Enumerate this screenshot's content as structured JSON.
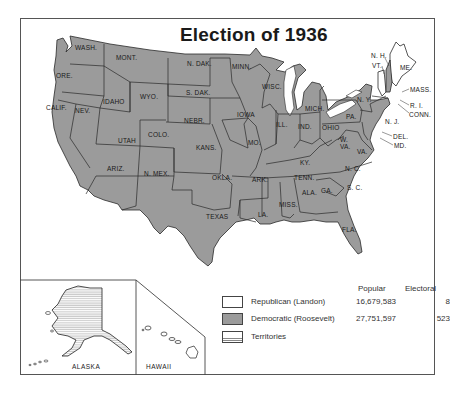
{
  "title": "Election of 1936",
  "colors": {
    "democratic": "#9b9b9b",
    "republican": "#ffffff",
    "outline": "#2a2a2a"
  },
  "states": [
    {
      "abbr": "WASH.",
      "party": "Democratic"
    },
    {
      "abbr": "ORE.",
      "party": "Democratic"
    },
    {
      "abbr": "CALIF.",
      "party": "Democratic"
    },
    {
      "abbr": "NEV.",
      "party": "Democratic"
    },
    {
      "abbr": "IDAHO",
      "party": "Democratic"
    },
    {
      "abbr": "MONT.",
      "party": "Democratic"
    },
    {
      "abbr": "WYO.",
      "party": "Democratic"
    },
    {
      "abbr": "UTAH",
      "party": "Democratic"
    },
    {
      "abbr": "COLO.",
      "party": "Democratic"
    },
    {
      "abbr": "ARIZ.",
      "party": "Democratic"
    },
    {
      "abbr": "N. MEX.",
      "party": "Democratic"
    },
    {
      "abbr": "N. DAK.",
      "party": "Democratic"
    },
    {
      "abbr": "S. DAK.",
      "party": "Democratic"
    },
    {
      "abbr": "NEBR.",
      "party": "Democratic"
    },
    {
      "abbr": "KANS.",
      "party": "Democratic"
    },
    {
      "abbr": "OKLA.",
      "party": "Democratic"
    },
    {
      "abbr": "TEXAS",
      "party": "Democratic"
    },
    {
      "abbr": "MINN.",
      "party": "Democratic"
    },
    {
      "abbr": "IOWA",
      "party": "Democratic"
    },
    {
      "abbr": "MO.",
      "party": "Democratic"
    },
    {
      "abbr": "ARK.",
      "party": "Democratic"
    },
    {
      "abbr": "LA.",
      "party": "Democratic"
    },
    {
      "abbr": "WISC.",
      "party": "Democratic"
    },
    {
      "abbr": "ILL.",
      "party": "Democratic"
    },
    {
      "abbr": "MICH.",
      "party": "Democratic"
    },
    {
      "abbr": "IND.",
      "party": "Democratic"
    },
    {
      "abbr": "OHIO",
      "party": "Democratic"
    },
    {
      "abbr": "KY.",
      "party": "Democratic"
    },
    {
      "abbr": "TENN.",
      "party": "Democratic"
    },
    {
      "abbr": "MISS.",
      "party": "Democratic"
    },
    {
      "abbr": "ALA.",
      "party": "Democratic"
    },
    {
      "abbr": "GA.",
      "party": "Democratic"
    },
    {
      "abbr": "FLA.",
      "party": "Democratic"
    },
    {
      "abbr": "S. C.",
      "party": "Democratic"
    },
    {
      "abbr": "N. C.",
      "party": "Democratic"
    },
    {
      "abbr": "VA.",
      "party": "Democratic"
    },
    {
      "abbr": "W. VA.",
      "party": "Democratic"
    },
    {
      "abbr": "PA.",
      "party": "Democratic"
    },
    {
      "abbr": "N. Y.",
      "party": "Democratic"
    },
    {
      "abbr": "N. J.",
      "party": "Democratic"
    },
    {
      "abbr": "DEL.",
      "party": "Democratic"
    },
    {
      "abbr": "MD.",
      "party": "Democratic"
    },
    {
      "abbr": "CONN.",
      "party": "Democratic"
    },
    {
      "abbr": "R. I.",
      "party": "Democratic"
    },
    {
      "abbr": "MASS.",
      "party": "Democratic"
    },
    {
      "abbr": "N. H.",
      "party": "Democratic"
    },
    {
      "abbr": "VT.",
      "party": "Republican"
    },
    {
      "abbr": "ME.",
      "party": "Republican"
    }
  ],
  "insets": {
    "alaska": "ALASKA",
    "hawaii": "HAWAII"
  },
  "legend": {
    "headers": {
      "popular": "Popular",
      "electoral": "Electoral"
    },
    "rows": [
      {
        "label": "Republican (Landon)",
        "popular": "16,679,583",
        "electoral": "8"
      },
      {
        "label": "Democratic (Roosevelt)",
        "popular": "27,751,597",
        "electoral": "523"
      },
      {
        "label": "Territories",
        "popular": "",
        "electoral": ""
      }
    ]
  }
}
